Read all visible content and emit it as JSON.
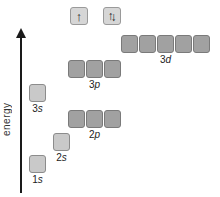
{
  "figure": {
    "energy_axis": {
      "label": "energy"
    },
    "spin_legend": {
      "single_up_arrow": "↑",
      "paired_up_arrow": "↑",
      "paired_down_arrow": "↓"
    },
    "orbitals": [
      {
        "id": "3d",
        "num": "3",
        "letter": "d",
        "boxes": 5,
        "shade": "dark"
      },
      {
        "id": "3p",
        "num": "3",
        "letter": "p",
        "boxes": 3,
        "shade": "dark"
      },
      {
        "id": "3s",
        "num": "3",
        "letter": "s",
        "boxes": 1,
        "shade": "light"
      },
      {
        "id": "2p",
        "num": "2",
        "letter": "p",
        "boxes": 3,
        "shade": "dark"
      },
      {
        "id": "2s",
        "num": "2",
        "letter": "s",
        "boxes": 1,
        "shade": "light"
      },
      {
        "id": "1s",
        "num": "1",
        "letter": "s",
        "boxes": 1,
        "shade": "light"
      }
    ],
    "colors": {
      "s_box_fill": "#c9c9c9",
      "s_box_border": "#8c8c8c",
      "pd_box_fill": "#a1a1a1",
      "pd_box_border": "#7a7a7a",
      "spin_box_fill": "#d6d6d6",
      "spin_box_border": "#9a9a9a",
      "axis_color": "#1a1a1a"
    }
  }
}
